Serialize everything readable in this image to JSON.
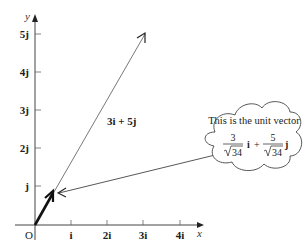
{
  "diagram": {
    "axes": {
      "x_label": "x",
      "y_label": "y",
      "origin_label": "O",
      "x_ticks": [
        "i",
        "2i",
        "3i",
        "4i"
      ],
      "y_ticks": [
        "j",
        "2j",
        "3j",
        "4j",
        "5j"
      ]
    },
    "vectors": [
      {
        "name": "vector-3i-5j",
        "label": "3i + 5j",
        "x": 3,
        "y": 5,
        "style": "thin"
      },
      {
        "name": "unit-vector",
        "label": "",
        "x": 0.514,
        "y": 0.857,
        "style": "bold"
      }
    ],
    "callout": {
      "text": "This is the unit vector",
      "term1_num": "3",
      "term1_den": "34",
      "term1_unit": "i",
      "plus": "+",
      "term2_num": "5",
      "term2_den": "34",
      "term2_unit": "j"
    },
    "colors": {
      "line": "#333333",
      "text": "#222222"
    }
  }
}
